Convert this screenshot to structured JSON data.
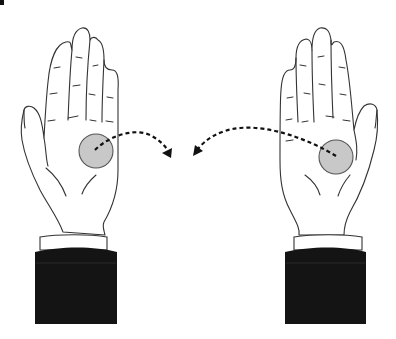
{
  "figure": {
    "title": "Coin transfer between palms",
    "colors": {
      "background": "#ffffff",
      "outline": "#333333",
      "skin": "#ffffff",
      "coin": "#c8c8c8",
      "coin_stroke": "#555555",
      "sleeve": "#141414",
      "cuff": "#ffffff",
      "arrow": "#111111"
    },
    "left_hand": {
      "label": "left-hand",
      "coin": {
        "cx": 96,
        "cy": 151,
        "r": 17
      }
    },
    "right_hand": {
      "label": "right-hand",
      "coin": {
        "cx": 336,
        "cy": 157,
        "r": 17
      }
    },
    "arrows": [
      {
        "from": "left-coin",
        "to": "center",
        "style": "dashed"
      },
      {
        "from": "right-coin",
        "to": "center",
        "style": "dashed"
      }
    ]
  }
}
